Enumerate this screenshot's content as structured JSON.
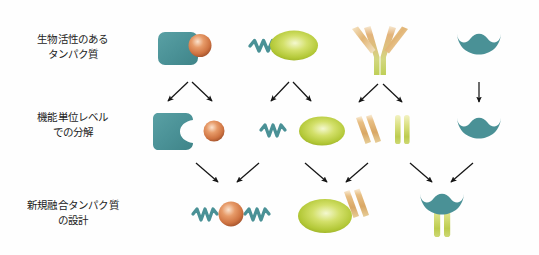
{
  "figure": {
    "title_rows": [
      {
        "id": "row-bioactive-protein",
        "text": "生物活性のある\nタンパク質"
      },
      {
        "id": "row-functional-unit",
        "text": "機能単位レベル\nでの分解"
      },
      {
        "id": "row-fusion-design",
        "text": "新規融合タンパク質\nの設計"
      }
    ],
    "colors": {
      "teal": "#4a9196",
      "teal_dark": "#3d8388",
      "orange": "#d9824e",
      "orange_light": "#f0c5a3",
      "orange_dark": "#b8623a",
      "green": "#b5c93f",
      "green_light": "#e3ec9e",
      "green_dark": "#97ab2c",
      "tan": "#e0b679",
      "tan_light": "#f5e3c2",
      "arrow": "#151515",
      "text": "#1c1c1c",
      "background": "#fefefe"
    },
    "row1": {
      "label": "生物活性のあるタンパク質",
      "items": [
        {
          "id": "protein-teal-block-with-sphere",
          "name": "teal-block-orange-sphere-complex"
        },
        {
          "id": "protein-squiggle-green-ellipse",
          "name": "linker-squiggle-green-ellipse-complex"
        },
        {
          "id": "protein-antibody-y",
          "name": "antibody-y-shape"
        },
        {
          "id": "protein-teal-crescent",
          "name": "teal-crescent-receptor"
        }
      ]
    },
    "row2": {
      "label": "機能単位レベルでの分解",
      "items": [
        {
          "id": "unit-teal-block-notched",
          "name": "teal-block-notched"
        },
        {
          "id": "unit-orange-sphere",
          "name": "orange-sphere"
        },
        {
          "id": "unit-squiggle",
          "name": "teal-squiggle-linker"
        },
        {
          "id": "unit-green-ellipse",
          "name": "green-ellipse-domain"
        },
        {
          "id": "unit-antibody-variable-arms",
          "name": "antibody-variable-arms-tan"
        },
        {
          "id": "unit-antibody-constant-stems",
          "name": "antibody-constant-stems-green"
        },
        {
          "id": "unit-teal-crescent",
          "name": "teal-crescent-receptor"
        }
      ]
    },
    "row3": {
      "label": "新規融合タンパク質の設計",
      "items": [
        {
          "id": "fusion-squiggle-sphere-squiggle",
          "name": "orange-sphere-double-squiggle-fusion"
        },
        {
          "id": "fusion-ellipse-variable-arms",
          "name": "green-ellipse-tan-arms-fusion"
        },
        {
          "id": "fusion-crescent-constant-stems",
          "name": "teal-crescent-green-stems-fusion"
        }
      ]
    },
    "arrows": {
      "split_group_1": {
        "name": "split-arrows-column-1",
        "type": "diverging-pair"
      },
      "split_group_2": {
        "name": "split-arrows-column-2",
        "type": "diverging-pair"
      },
      "split_group_3": {
        "name": "split-arrows-column-3",
        "type": "diverging-pair"
      },
      "pass_through_4": {
        "name": "pass-through-arrow-column-4",
        "type": "straight-down"
      },
      "merge_group_1": {
        "name": "merge-arrows-fusion-1",
        "type": "converging-pair"
      },
      "merge_group_2": {
        "name": "merge-arrows-fusion-2",
        "type": "converging-pair"
      },
      "merge_group_3": {
        "name": "merge-arrows-fusion-3",
        "type": "converging-pair"
      }
    }
  }
}
